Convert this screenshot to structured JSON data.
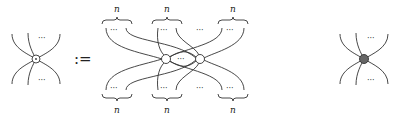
{
  "diagram": {
    "definition_symbol": ":=",
    "ellipsis": "···",
    "brace_label": "n",
    "left_node": {
      "style": "open-circle-with-dot"
    },
    "middle": {
      "top_groups": [
        "n",
        "n",
        "n"
      ],
      "bottom_groups": [
        "n",
        "n",
        "n"
      ],
      "nodes": [
        "open-circle",
        "open-circle"
      ]
    },
    "right_node": {
      "style": "filled-gray",
      "color": "#666666"
    }
  }
}
